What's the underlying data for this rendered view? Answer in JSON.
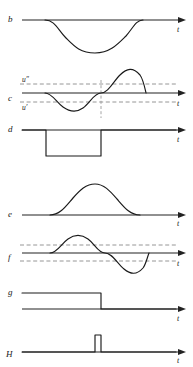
{
  "figure": {
    "type": "signal-waveform-diagram",
    "background": "#ffffff",
    "stroke_color": "#1a1a1a",
    "dash_color": "#8a8a8a",
    "axis_label": "t",
    "panel_count": 7
  },
  "panels": [
    {
      "id": "b",
      "label": "b",
      "axis_label": "t",
      "waveform": "negative-dip",
      "description": "flat baseline with a single smooth downward dip",
      "start_x": 45,
      "end_x": 143,
      "extremum_x": 95,
      "dashed_levels": [],
      "level_labels": []
    },
    {
      "id": "c",
      "label": "c",
      "axis_label": "t",
      "waveform": "sine-one-cycle",
      "description": "one full sine cycle, negative half first then positive half, crossing two dashed threshold levels",
      "start_x": 45,
      "end_x": 143,
      "dashed_levels": [
        "u''",
        "u'"
      ],
      "level_labels": [
        {
          "text": "u″",
          "position": "above-axis"
        },
        {
          "text": "u′",
          "position": "below-axis"
        }
      ],
      "vertical_dropline_x": 101
    },
    {
      "id": "d",
      "label": "d",
      "axis_label": "t",
      "waveform": "negative-rectangular-pulse",
      "description": "step down then step back up, forming a negative rectangular pulse",
      "pulse_start_x": 46,
      "pulse_end_x": 101,
      "dashed_levels": [],
      "level_labels": []
    },
    {
      "id": "e",
      "label": "e",
      "axis_label": "t",
      "waveform": "positive-bump",
      "description": "flat baseline with a single smooth positive bump",
      "start_x": 50,
      "end_x": 140,
      "extremum_x": 95,
      "dashed_levels": [],
      "level_labels": []
    },
    {
      "id": "f",
      "label": "f",
      "axis_label": "t",
      "waveform": "sine-one-cycle",
      "description": "one full sine cycle, positive half first then negative half, with two unlabeled dashed threshold levels",
      "start_x": 50,
      "end_x": 140,
      "dashed_levels": [
        "upper",
        "lower"
      ],
      "level_labels": []
    },
    {
      "id": "g",
      "label": "g",
      "axis_label": "t",
      "waveform": "falling-step",
      "description": "high level that steps down to baseline",
      "step_x": 101,
      "dashed_levels": [],
      "level_labels": []
    },
    {
      "id": "H",
      "label": "H",
      "axis_label": "t",
      "waveform": "narrow-positive-spike",
      "description": "flat baseline with one narrow tall rectangular spike",
      "spike_start_x": 95,
      "spike_end_x": 101,
      "dashed_levels": [],
      "level_labels": []
    }
  ]
}
